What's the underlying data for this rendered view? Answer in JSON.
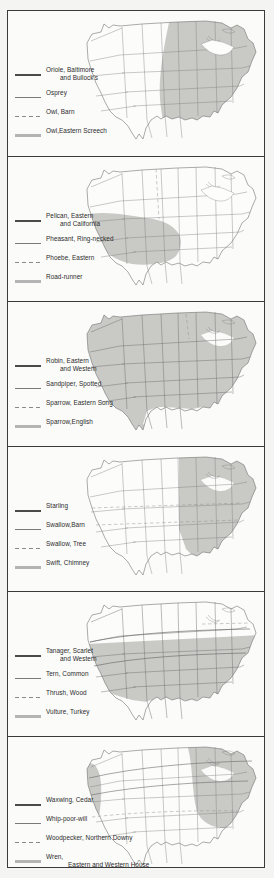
{
  "figure": {
    "type": "map-series",
    "panel_count": 6,
    "swatch_styles": [
      "solid",
      "thin",
      "dashed",
      "thick-gray"
    ],
    "map_subject": "United States range maps"
  },
  "panels": [
    {
      "id": "panel-1",
      "shading": "eastern-us",
      "legend": [
        {
          "style": "solid",
          "label": "Oriole, Baltimore",
          "label2": "and Bullock's"
        },
        {
          "style": "thin",
          "label": "Osprey",
          "label2": ""
        },
        {
          "style": "dashed",
          "label": "Owl, Barn",
          "label2": ""
        },
        {
          "style": "thick",
          "label": "Owl,Eastern Screech",
          "label2": ""
        }
      ]
    },
    {
      "id": "panel-2",
      "shading": "southwest-us",
      "legend": [
        {
          "style": "solid",
          "label": "Pelican, Eastern",
          "label2": "and California"
        },
        {
          "style": "thin",
          "label": "Pheasant, Ring-necked",
          "label2": ""
        },
        {
          "style": "dashed",
          "label": "Phoebe, Eastern",
          "label2": ""
        },
        {
          "style": "thick",
          "label": "Road-runner",
          "label2": ""
        }
      ]
    },
    {
      "id": "panel-3",
      "shading": "nearly-all-us",
      "legend": [
        {
          "style": "solid",
          "label": "Robin, Eastern",
          "label2": "and Western"
        },
        {
          "style": "thin",
          "label": "Sandpiper, Spotted",
          "label2": ""
        },
        {
          "style": "dashed",
          "label": "Sparrow, Eastern Song",
          "label2": ""
        },
        {
          "style": "thick",
          "label": "Sparrow,English",
          "label2": ""
        }
      ]
    },
    {
      "id": "panel-4",
      "shading": "eastern-half-us",
      "legend": [
        {
          "style": "solid",
          "label": "Starling",
          "label2": ""
        },
        {
          "style": "thin",
          "label": "Swallow,Barn",
          "label2": ""
        },
        {
          "style": "dashed",
          "label": "Swallow, Tree",
          "label2": ""
        },
        {
          "style": "thick",
          "label": "Swift, Chimney",
          "label2": ""
        }
      ]
    },
    {
      "id": "panel-5",
      "shading": "central-band-us",
      "legend": [
        {
          "style": "solid",
          "label": "Tanager, Scarlet",
          "label2": "and Western"
        },
        {
          "style": "thin",
          "label": "Tern, Common",
          "label2": ""
        },
        {
          "style": "dashed",
          "label": "Thrush, Wood",
          "label2": ""
        },
        {
          "style": "thick",
          "label": "Vulture, Turkey",
          "label2": ""
        }
      ]
    },
    {
      "id": "panel-6",
      "shading": "west-coast-and-northeast",
      "legend": [
        {
          "style": "solid",
          "label": "Waxwing, Cedar",
          "label2": ""
        },
        {
          "style": "thin",
          "label": "Whip-poor-will",
          "label2": ""
        },
        {
          "style": "dashed",
          "label": "Woodpecker, Northern Downy",
          "label2": ""
        },
        {
          "style": "thick",
          "label": "Wren,",
          "label2": "Eastern and Western House"
        }
      ]
    }
  ],
  "colors": {
    "frame_border": "#3a3a3a",
    "page_background": "#f4f4f2",
    "map_outline": "#555555",
    "state_line": "#6e6e6e",
    "shading_fill": "#c9c9c6",
    "legend_text": "#2b2b2b"
  }
}
